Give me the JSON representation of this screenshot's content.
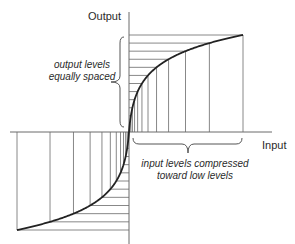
{
  "diagram": {
    "y_axis_label": "Output",
    "x_axis_label": "Input",
    "annotation_output": {
      "line1": "output levels",
      "line2": "equally spaced"
    },
    "annotation_input": {
      "line1": "input levels compressed",
      "line2": "toward low levels"
    },
    "colors": {
      "background": "#ffffff",
      "grid_line": "#7a7a7a",
      "axis": "#6a6a6a",
      "curve": "#222222",
      "text": "#2a2a2a"
    },
    "geometry": {
      "origin_x": 129,
      "origin_y": 132,
      "x_axis_start": 10,
      "x_axis_end": 272,
      "y_axis_top": 12,
      "y_axis_bottom": 244,
      "pos_max_x": 243,
      "pos_max_y": 35,
      "neg_max_x": 17,
      "neg_max_y": 230,
      "levels": 12,
      "mu": 60
    }
  }
}
